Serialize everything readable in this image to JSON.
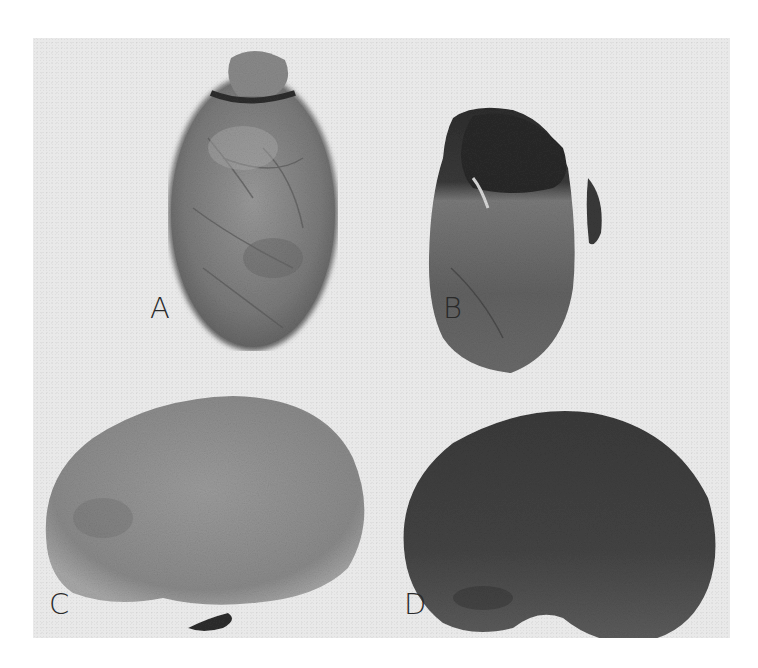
{
  "figure": {
    "panels": [
      {
        "id": "A",
        "label": "A",
        "subject": "seed-with-intact-coat-oblong",
        "tone": "#7e7e7e"
      },
      {
        "id": "B",
        "label": "B",
        "subject": "seed-with-coat-partially-removed",
        "tone": "#5c5c5c"
      },
      {
        "id": "C",
        "label": "C",
        "subject": "kidney-shaped-seed-light",
        "tone": "#8e8e8e"
      },
      {
        "id": "D",
        "label": "D",
        "subject": "kidney-shaped-seed-dark",
        "tone": "#4a4a4a"
      }
    ],
    "colors": {
      "page_background": "#ffffff",
      "plate_background": "#e9e9e9",
      "label_color": "#2a2a2a"
    }
  }
}
